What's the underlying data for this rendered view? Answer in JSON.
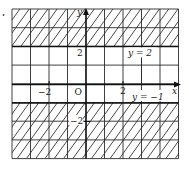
{
  "figure": {
    "axes": {
      "x_label": "x",
      "y_label": "y",
      "origin_label": "O",
      "x_tick_labels": [
        {
          "value": -2,
          "text": "−2"
        },
        {
          "value": 2,
          "text": "2"
        }
      ],
      "y_tick_labels": [
        {
          "value": 2,
          "text": "2"
        },
        {
          "value": -2,
          "text": "−2"
        }
      ],
      "x_range": [
        -4,
        5
      ],
      "y_range": [
        -4,
        4
      ]
    },
    "boundary_lines": [
      {
        "equation": "y = 2",
        "label": "y = 2",
        "value": 2
      },
      {
        "equation": "y = −1",
        "label": "y = −1",
        "value": -1
      }
    ],
    "shaded_regions": [
      {
        "description": "y ≥ 2",
        "from": 2,
        "to": 4
      },
      {
        "description": "y ≤ −1",
        "from": -4,
        "to": -1
      }
    ],
    "colors": {
      "ink": "#1a1a1a",
      "background": "#ffffff"
    }
  }
}
